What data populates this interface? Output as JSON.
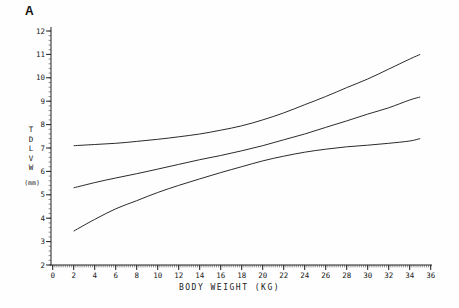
{
  "colors": {
    "line": "#2b2b2b",
    "axis": "#222222",
    "text": "#1a1a1a",
    "background": "#fefefe"
  },
  "chart_data": {
    "type": "line",
    "panel_label": "A",
    "title": "",
    "xlabel": "BODY WEIGHT (KG)",
    "ylabel_stacked": "T\nD\nL\nV\nW",
    "ylabel": "TDLVW",
    "ylabel_unit": "(mm)",
    "xlim": [
      0,
      36
    ],
    "ylim": [
      2,
      12
    ],
    "x_major_ticks": [
      0,
      2,
      4,
      6,
      8,
      10,
      12,
      14,
      16,
      18,
      20,
      22,
      24,
      26,
      28,
      30,
      32,
      34,
      36
    ],
    "y_major_ticks": [
      2,
      3,
      4,
      5,
      6,
      7,
      8,
      9,
      10,
      11,
      12
    ],
    "x_minor_step": 0.2,
    "y_minor_step": 0.2,
    "grid": false,
    "legend": "none",
    "x": [
      2,
      4,
      6,
      8,
      10,
      12,
      14,
      16,
      18,
      20,
      22,
      24,
      26,
      28,
      30,
      32,
      34,
      35
    ],
    "series": [
      {
        "name": "upper-confidence-band",
        "y": [
          7.1,
          7.15,
          7.2,
          7.28,
          7.37,
          7.48,
          7.6,
          7.76,
          7.95,
          8.2,
          8.5,
          8.85,
          9.2,
          9.58,
          9.95,
          10.37,
          10.8,
          11.0
        ]
      },
      {
        "name": "regression-mean",
        "y": [
          5.3,
          5.52,
          5.72,
          5.9,
          6.1,
          6.3,
          6.5,
          6.68,
          6.88,
          7.1,
          7.35,
          7.6,
          7.88,
          8.16,
          8.45,
          8.72,
          9.05,
          9.18
        ]
      },
      {
        "name": "lower-confidence-band",
        "y": [
          3.45,
          3.95,
          4.4,
          4.75,
          5.1,
          5.4,
          5.68,
          5.95,
          6.2,
          6.45,
          6.65,
          6.82,
          6.95,
          7.05,
          7.12,
          7.2,
          7.3,
          7.4
        ]
      }
    ]
  }
}
